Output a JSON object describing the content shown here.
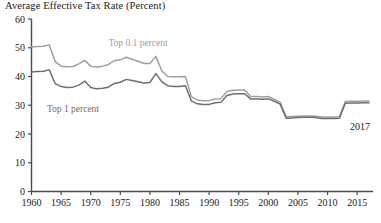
{
  "chart_data": {
    "type": "line",
    "title": "Average Effective Tax Rate (Percent)",
    "xlabel": "",
    "ylabel": "",
    "ylim": [
      0,
      60
    ],
    "xlim": [
      1960,
      2017
    ],
    "yticks": [
      0,
      10,
      20,
      30,
      40,
      50,
      60
    ],
    "xticks": [
      1960,
      1965,
      1970,
      1975,
      1980,
      1985,
      1990,
      1995,
      2000,
      2005,
      2010,
      2015
    ],
    "grid": false,
    "legend_position": "inline-labels",
    "annotations": [
      {
        "text": "2017",
        "x": 2015.5,
        "y": 21.5
      }
    ],
    "x": [
      1960,
      1961,
      1962,
      1963,
      1964,
      1965,
      1966,
      1967,
      1968,
      1969,
      1970,
      1971,
      1972,
      1973,
      1974,
      1975,
      1976,
      1977,
      1978,
      1979,
      1980,
      1981,
      1982,
      1983,
      1984,
      1985,
      1986,
      1987,
      1988,
      1989,
      1990,
      1991,
      1992,
      1993,
      1994,
      1995,
      1996,
      1997,
      1998,
      1999,
      2000,
      2001,
      2002,
      2003,
      2004,
      2005,
      2006,
      2007,
      2008,
      2009,
      2010,
      2011,
      2012,
      2013,
      2014,
      2015,
      2016,
      2017
    ],
    "series": [
      {
        "name": "Top 0.1 percent",
        "color": "#a0a0a0",
        "label_x": 1978,
        "label_y": 50.5,
        "values": [
          50.3,
          50.4,
          50.5,
          51.0,
          45.2,
          43.6,
          43.4,
          43.5,
          44.4,
          45.6,
          43.6,
          43.3,
          43.6,
          44.2,
          45.5,
          45.8,
          46.7,
          46.0,
          45.3,
          44.5,
          44.5,
          47.0,
          42.0,
          40.0,
          39.9,
          39.9,
          40.0,
          33.0,
          31.8,
          31.6,
          31.6,
          32.2,
          32.3,
          34.8,
          35.2,
          35.3,
          35.3,
          33.0,
          33.0,
          32.9,
          33.0,
          32.1,
          31.0,
          26.0,
          26.1,
          26.2,
          26.3,
          26.3,
          26.2,
          25.9,
          25.9,
          25.9,
          26.0,
          31.3,
          31.4,
          31.4,
          31.5,
          31.5
        ]
      },
      {
        "name": "Top 1 percent",
        "color": "#6e6e6e",
        "label_x": 1967,
        "label_y": 27.5,
        "values": [
          41.6,
          41.7,
          41.8,
          42.3,
          37.5,
          36.5,
          36.2,
          36.3,
          37.0,
          38.4,
          36.2,
          35.7,
          35.9,
          36.3,
          37.6,
          38.0,
          39.0,
          38.6,
          38.2,
          37.7,
          37.9,
          41.0,
          38.2,
          36.8,
          36.5,
          36.5,
          36.8,
          31.5,
          30.5,
          30.3,
          30.3,
          30.9,
          31.0,
          33.4,
          33.9,
          34.0,
          34.0,
          32.2,
          32.2,
          32.1,
          32.2,
          31.4,
          30.4,
          25.5,
          25.6,
          25.7,
          25.8,
          25.8,
          25.7,
          25.4,
          25.4,
          25.4,
          25.5,
          30.7,
          30.8,
          30.8,
          30.9,
          30.9
        ]
      }
    ]
  },
  "axis": {
    "color": "#4a4a4a"
  }
}
